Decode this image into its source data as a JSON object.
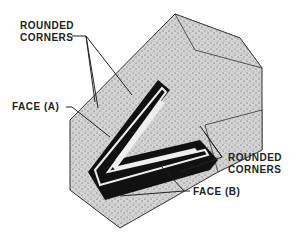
{
  "diagram": {
    "type": "technical-illustration",
    "labels": {
      "top_left_line1": "ROUNDED",
      "top_left_line2": "CORNERS",
      "face_a": "FACE (A)",
      "right_line1": "ROUNDED",
      "right_line2": "CORNERS",
      "face_b": "FACE (B)"
    },
    "colors": {
      "texture": "#cfcfcf",
      "dark": "#111111",
      "line": "#222222"
    }
  }
}
